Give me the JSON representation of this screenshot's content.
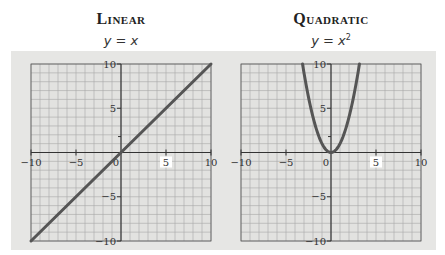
{
  "panels": [
    {
      "title": "Linear",
      "equation": "y = x",
      "equation_base": "y = x",
      "equation_exp": ""
    },
    {
      "title": "Quadratic",
      "equation": "y = x²",
      "equation_base": "y = x",
      "equation_exp": "2"
    }
  ],
  "colors": {
    "background_band": "#e6e6e4",
    "grid_line": "#9a9a9a",
    "axis": "#333333",
    "curve": "#555555"
  },
  "chart_data": [
    {
      "type": "line",
      "title": "Linear",
      "subtitle": "y = x",
      "function": "y = x",
      "x": [
        -10,
        -5,
        0,
        5,
        10
      ],
      "y": [
        -10,
        -5,
        0,
        5,
        10
      ],
      "xlim": [
        -10,
        10
      ],
      "ylim": [
        -10,
        10
      ],
      "x_tick_labels": [
        "-10",
        "-5",
        "0",
        "5",
        "10"
      ],
      "y_tick_labels": [
        "10",
        "5",
        "-5",
        "-10"
      ],
      "grid": true,
      "minor_gridlines_per_unit": 1,
      "xlabel": "",
      "ylabel": "",
      "legend": null
    },
    {
      "type": "line",
      "title": "Quadratic",
      "subtitle": "y = x²",
      "function": "y = x^2",
      "x": [
        -3.16,
        -3,
        -2,
        -1,
        0,
        1,
        2,
        3,
        3.16
      ],
      "y": [
        10,
        9,
        4,
        1,
        0,
        1,
        4,
        9,
        10
      ],
      "xlim": [
        -10,
        10
      ],
      "ylim": [
        -10,
        10
      ],
      "x_tick_labels": [
        "-10",
        "-5",
        "0",
        "5",
        "10"
      ],
      "y_tick_labels": [
        "10",
        "5",
        "-5",
        "-10"
      ],
      "grid": true,
      "minor_gridlines_per_unit": 1,
      "xlabel": "",
      "ylabel": "",
      "legend": null
    }
  ]
}
